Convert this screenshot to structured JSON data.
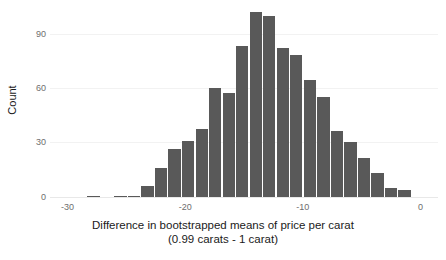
{
  "chart_data": {
    "type": "bar",
    "subtype": "histogram",
    "title": "",
    "xlabel": "Difference in bootstrapped means of price per carat",
    "xlabel_line2": "(0.99 carats - 1 carat)",
    "ylabel": "Count",
    "xlim": [
      -31.5,
      1.5
    ],
    "ylim": [
      0,
      115
    ],
    "xticks": [
      -30,
      -20,
      -10,
      0
    ],
    "xtick_labels": [
      "-30",
      "-20",
      "-10",
      "0"
    ],
    "yticks": [
      0,
      30,
      60,
      90
    ],
    "ytick_labels": [
      "0",
      "30",
      "60",
      "90"
    ],
    "grid": "horizontal-light",
    "legend": "none",
    "bar_color": "#595959",
    "bin_width": 1.15,
    "bin_centers": [
      -28.9,
      -27.75,
      -26.6,
      -25.45,
      -24.3,
      -23.15,
      -22.0,
      -20.85,
      -19.7,
      -18.55,
      -17.4,
      -16.25,
      -15.1,
      -13.95,
      -12.8,
      -11.65,
      -10.5,
      -9.35,
      -8.2,
      -7.05,
      -5.9,
      -4.75,
      -3.6,
      -2.45,
      -1.3
    ],
    "categories": [
      "-28.9",
      "-27.75",
      "-26.6",
      "-25.45",
      "-24.3",
      "-23.15",
      "-22.0",
      "-20.85",
      "-19.7",
      "-18.55",
      "-17.4",
      "-16.25",
      "-15.1",
      "-13.95",
      "-12.8",
      "-11.65",
      "-10.5",
      "-9.35",
      "-8.2",
      "-7.05",
      "-5.9",
      "-4.75",
      "-3.6",
      "-2.45",
      "-1.3"
    ],
    "values": [
      0,
      1,
      0,
      1,
      1,
      4,
      10,
      16,
      19,
      23,
      36,
      34,
      50,
      61,
      60,
      49,
      47,
      38,
      33,
      22,
      18,
      13,
      8,
      3,
      2
    ],
    "values_count_scale": [
      0,
      1,
      0,
      1,
      1,
      7,
      18,
      29,
      34,
      41,
      65,
      62,
      90,
      110,
      108,
      89,
      85,
      70,
      60,
      40,
      33,
      24,
      15,
      6,
      5
    ]
  }
}
